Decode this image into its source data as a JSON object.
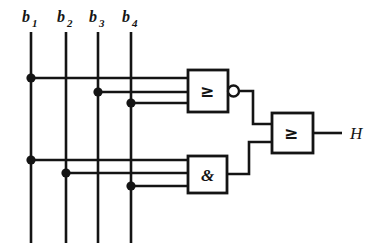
{
  "diagram": {
    "kind": "logic-circuit-schematic",
    "title": "",
    "output_label": "H",
    "inputs": [
      {
        "id": "b1",
        "label": "b",
        "subscript": "1",
        "x": 31
      },
      {
        "id": "b2",
        "label": "b",
        "subscript": "2",
        "x": 66
      },
      {
        "id": "b3",
        "label": "b",
        "subscript": "3",
        "x": 98
      },
      {
        "id": "b4",
        "label": "b",
        "subscript": "4",
        "x": 131
      }
    ],
    "gates": [
      {
        "id": "gate-nor",
        "symbol": "≥",
        "type": "nor",
        "inverted_output": true,
        "inputs": [
          "b1",
          "b3",
          "b4"
        ],
        "box": {
          "x": 188,
          "y": 70,
          "w": 40,
          "h": 42
        }
      },
      {
        "id": "gate-and",
        "symbol": "&",
        "type": "and",
        "inverted_output": false,
        "inputs": [
          "b1",
          "b2",
          "b4"
        ],
        "box": {
          "x": 188,
          "y": 156,
          "w": 39,
          "h": 37
        }
      },
      {
        "id": "gate-or-out",
        "symbol": "≥",
        "type": "or",
        "inverted_output": false,
        "inputs": [
          "gate-nor",
          "gate-and"
        ],
        "box": {
          "x": 272,
          "y": 113,
          "w": 41,
          "h": 40
        }
      }
    ],
    "colors": {
      "ink": "#141414",
      "background": "#ffffff"
    }
  }
}
